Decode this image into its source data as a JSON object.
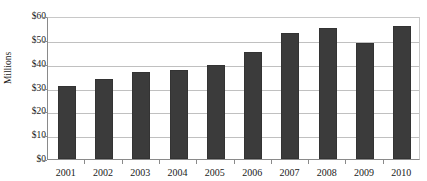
{
  "chart_data": {
    "type": "bar",
    "title": "",
    "title_note": "title row is cropped off the top edge of the screenshot",
    "xlabel": "",
    "ylabel": "Millions",
    "categories": [
      "2001",
      "2002",
      "2003",
      "2004",
      "2005",
      "2006",
      "2007",
      "2008",
      "2009",
      "2010"
    ],
    "values": [
      30.5,
      33.5,
      36.5,
      37.5,
      39.5,
      45.0,
      53.0,
      55.0,
      48.5,
      56.0
    ],
    "ylim": [
      0,
      60
    ],
    "ytick_step": 10,
    "ytick_labels": [
      "$0",
      "$10",
      "$20",
      "$30",
      "$40",
      "$50",
      "$60"
    ],
    "ytick_values": [
      0,
      10,
      20,
      30,
      40,
      50,
      60
    ],
    "grid": true,
    "grid_axis": "y",
    "legend": false,
    "legend_position": "none",
    "value_prefix": "$",
    "bar_color": "#3b3b3b",
    "bar_border_color": "#333333",
    "gridline_color": "#c0c0c0",
    "axis_color": "#8a8a8a",
    "plot_background": "#ffffff",
    "page_background": "#ffffff",
    "text_color": "#1a1a1a"
  }
}
